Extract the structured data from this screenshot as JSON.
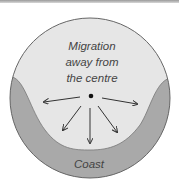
{
  "diagram": {
    "labels": {
      "migration_line1": "Migration",
      "migration_line2": "away from",
      "migration_line3": "the centre",
      "coast": "Coast"
    },
    "colors": {
      "inland": "#e6e6e6",
      "coast": "#a9a9a9",
      "outline": "#666666",
      "arrow": "#333333"
    },
    "arrows_count": 5
  }
}
